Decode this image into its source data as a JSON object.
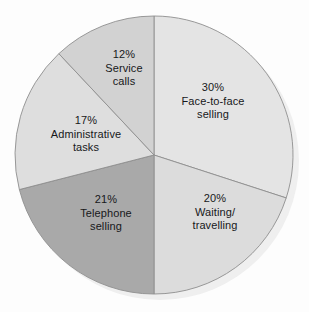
{
  "chart_data": {
    "type": "pie",
    "title": "",
    "subtitle": "",
    "xlabel": "",
    "ylabel": "",
    "legend_position": "none",
    "grid": false,
    "labels_inside_slices": true,
    "units": "percent",
    "total": 100,
    "categories": [
      "Face-to-face selling",
      "Waiting/travelling",
      "Telephone selling",
      "Administrative tasks",
      "Service calls"
    ],
    "values": [
      30,
      20,
      21,
      17,
      12
    ],
    "slices": [
      {
        "percent_text": "30%",
        "value": 30,
        "label_lines": [
          "Face-to-face",
          "selling"
        ],
        "label_full": "Face-to-face selling",
        "color": "#e4e4e4",
        "start_angle_deg": 0,
        "end_angle_deg": 108,
        "label_x": 213,
        "label_y": 101
      },
      {
        "percent_text": "20%",
        "value": 20,
        "label_lines": [
          "Waiting/",
          "travelling"
        ],
        "label_full": "Waiting/travelling",
        "color": "#dcdcdc",
        "start_angle_deg": 108,
        "end_angle_deg": 180,
        "label_x": 215,
        "label_y": 212
      },
      {
        "percent_text": "21%",
        "value": 21,
        "label_lines": [
          "Telephone",
          "selling"
        ],
        "label_full": "Telephone selling",
        "color": "#a9a9a9",
        "start_angle_deg": 180,
        "end_angle_deg": 255.6,
        "label_x": 106,
        "label_y": 213
      },
      {
        "percent_text": "17%",
        "value": 17,
        "label_lines": [
          "Administrative",
          "tasks"
        ],
        "label_full": "Administrative tasks",
        "color": "#dedede",
        "start_angle_deg": 255.6,
        "end_angle_deg": 316.8,
        "label_x": 86,
        "label_y": 134
      },
      {
        "percent_text": "12%",
        "value": 12,
        "label_lines": [
          "Service",
          "calls"
        ],
        "label_full": "Service calls",
        "color": "#d2d2d2",
        "start_angle_deg": 316.8,
        "end_angle_deg": 360,
        "label_x": 124,
        "label_y": 68
      }
    ],
    "geometry": {
      "center_x": 154,
      "center_y": 155,
      "radius": 139
    },
    "style": {
      "background": "#fdfdfd",
      "slice_outline": "#8e8e8e",
      "shadow": "#efefef",
      "label_color": "#17181a"
    }
  }
}
